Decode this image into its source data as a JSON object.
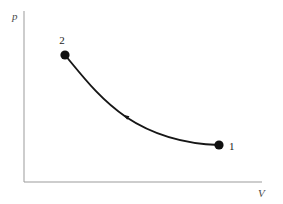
{
  "figure": {
    "name": "pressure-volume-diagram",
    "background_color": "#ffffff",
    "width": 283,
    "height": 204
  },
  "axes": {
    "color": "#9b9b9b",
    "line_width": 1,
    "y_axis": {
      "label": "p",
      "x": 24,
      "y_top": 11,
      "y_bottom": 182
    },
    "x_axis": {
      "label": "V",
      "y": 182,
      "x_left": 24,
      "x_right": 262
    }
  },
  "curve": {
    "color": "#161616",
    "line_width": 1.9,
    "path": "M 65 55 C 84 78, 100 99, 126 117 C 153 135, 186 144, 219 145",
    "direction_marker": {
      "name": "process-direction-arrow",
      "x": 126,
      "y": 116.5,
      "points_toward": "2"
    }
  },
  "points": [
    {
      "id": "state-2",
      "label": "2",
      "cx": 65,
      "cy": 55,
      "r": 4.6,
      "color": "#101010",
      "label_x": 62,
      "label_y": 44
    },
    {
      "id": "state-1",
      "label": "1",
      "cx": 219,
      "cy": 145,
      "r": 4.6,
      "color": "#101010",
      "label_x": 229,
      "label_y": 150
    }
  ],
  "chart_data": {
    "type": "line",
    "title": "",
    "xlabel": "V",
    "ylabel": "p",
    "grid": false,
    "legend": null,
    "axis_ticks": {
      "x": [],
      "y": []
    },
    "series": [
      {
        "name": "process 1-2 (compression)",
        "description": "Smooth monotonically decreasing hyperbola-like curve from state 1 (large V, low p) to state 2 (small V, high p)",
        "x": [
          65,
          82,
          100,
          126,
          155,
          187,
          219
        ],
        "y": [
          55,
          76,
          94,
          117,
          134,
          142,
          145
        ]
      }
    ],
    "annotations": [
      {
        "text": "2",
        "x": 65,
        "y": 55,
        "marker": "filled-circle",
        "note": "end state, high pressure / low volume"
      },
      {
        "text": "1",
        "x": 219,
        "y": 145,
        "marker": "filled-circle",
        "note": "start state, low pressure / high volume"
      },
      {
        "text": "",
        "x": 126,
        "y": 117,
        "marker": "arrowhead",
        "note": "process direction arrow pointing from 1 toward 2"
      }
    ]
  }
}
